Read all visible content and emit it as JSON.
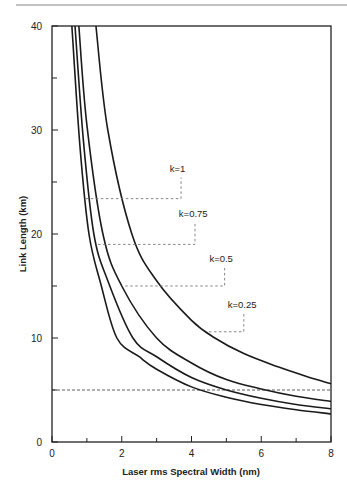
{
  "chart_data": {
    "type": "line",
    "title": "",
    "xlabel": "Laser rms Spectral Width (nm)",
    "ylabel": "Link Length (km)",
    "xlim": [
      0,
      8
    ],
    "ylim": [
      0,
      40
    ],
    "xticks": [
      0,
      2,
      4,
      6,
      8
    ],
    "xminor": [
      1,
      3,
      5,
      7
    ],
    "yticks": [
      0,
      10,
      20,
      30,
      40
    ],
    "yminor": [
      5,
      15,
      25,
      35
    ],
    "grid": false,
    "legend": "none (inline annotations)",
    "series": [
      {
        "name": "k=0.25",
        "x": [
          0.57,
          0.8,
          1.06,
          1.4,
          1.86,
          2.5,
          3.0,
          4.0,
          5.0,
          6.0,
          7.0,
          8.0
        ],
        "y": [
          40,
          28.5,
          20,
          15.2,
          10,
          8.2,
          7.0,
          5.3,
          4.3,
          3.6,
          3.1,
          2.7
        ]
      },
      {
        "name": "k=0.5",
        "x": [
          0.66,
          0.9,
          1.2,
          1.6,
          2.32,
          3.0,
          4.0,
          5.0,
          6.0,
          7.0,
          8.0
        ],
        "y": [
          40,
          29,
          20,
          15.5,
          10,
          8.2,
          6.2,
          5.0,
          4.2,
          3.6,
          3.2
        ]
      },
      {
        "name": "k=0.75",
        "x": [
          0.77,
          1.0,
          1.46,
          2.0,
          3.0,
          4.0,
          5.0,
          6.0,
          7.0,
          8.0
        ],
        "y": [
          40,
          30.5,
          20,
          15.0,
          10,
          7.6,
          6.0,
          5.1,
          4.4,
          3.9
        ]
      },
      {
        "name": "k=1",
        "x": [
          1.26,
          1.6,
          2.29,
          3.0,
          4.0,
          4.67,
          5.5,
          6.5,
          7.3,
          8.0
        ],
        "y": [
          40,
          30.0,
          20,
          15.5,
          11.7,
          10,
          8.5,
          7.2,
          6.3,
          5.6
        ]
      }
    ],
    "annotations": [
      {
        "label": "k=1",
        "y_level": 23.4,
        "x_start": 0.97,
        "x_corner": 3.7,
        "label_x": 3.6,
        "label_y": 26.0
      },
      {
        "label": "k=0.75",
        "y_level": 19.0,
        "x_start": 1.32,
        "x_corner": 4.1,
        "label_x": 4.05,
        "label_y": 21.6
      },
      {
        "label": "k=0.5",
        "y_level": 15.0,
        "x_start": 2.1,
        "x_corner": 4.95,
        "label_x": 4.85,
        "label_y": 17.3
      },
      {
        "label": "k=0.25",
        "y_level": 10.6,
        "x_start": 4.5,
        "x_corner": 5.5,
        "label_x": 5.45,
        "label_y": 12.9
      }
    ],
    "reference_line": {
      "y": 5,
      "style": "dashed",
      "x_from": 0,
      "x_to": 8
    }
  }
}
